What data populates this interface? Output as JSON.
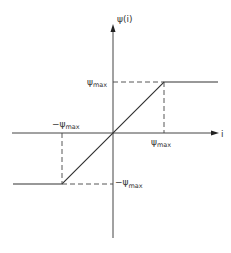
{
  "diagram": {
    "type": "saturation-characteristic",
    "axes": {
      "y_label": "ψ(i)",
      "x_label": "i"
    },
    "labels": {
      "psi_max_top_left": {
        "symbol": "ψ",
        "sub": "max",
        "prefix": ""
      },
      "neg_psi_max_upper_left": {
        "symbol": "ψ",
        "sub": "max",
        "prefix": "−"
      },
      "psi_max_x_axis": {
        "symbol": "ψ",
        "sub": "max",
        "prefix": ""
      },
      "neg_psi_max_lower_right": {
        "symbol": "ψ",
        "sub": "max",
        "prefix": "−"
      }
    },
    "colors": {
      "line": "#333333",
      "axis": "#444444"
    }
  }
}
